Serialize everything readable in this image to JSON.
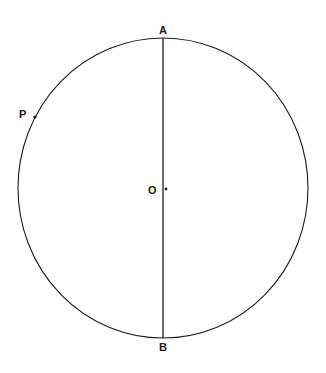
{
  "figure": {
    "type": "geometry-diagram",
    "background_color": "#ffffff",
    "stroke_color": "#1a1a1a",
    "canvas": {
      "width": 326,
      "height": 373
    },
    "circle": {
      "name": "main-circle",
      "center_x": 163,
      "center_y": 188,
      "radius_x": 145,
      "radius_y": 150,
      "stroke_width": 1.1
    },
    "diameter": {
      "name": "diameter-AB",
      "x1": 163,
      "y1": 38,
      "x2": 163,
      "y2": 338,
      "stroke_width": 1.3
    },
    "points": [
      {
        "id": "A",
        "label": "A",
        "x": 163,
        "y": 38,
        "label_x": 163,
        "label_y": 30,
        "marker": false
      },
      {
        "id": "B",
        "label": "B",
        "x": 163,
        "y": 338,
        "label_x": 163,
        "label_y": 347,
        "marker": false
      },
      {
        "id": "O",
        "label": "O",
        "x": 166,
        "y": 189,
        "label_x": 152,
        "label_y": 190,
        "marker": true,
        "marker_radius": 1.4
      },
      {
        "id": "P",
        "label": "P",
        "x": 35,
        "y": 117,
        "label_x": 23,
        "label_y": 114,
        "marker": true,
        "marker_radius": 1.6
      }
    ],
    "labels": {
      "a": "A",
      "b": "B",
      "o": "O",
      "p": "P"
    }
  }
}
